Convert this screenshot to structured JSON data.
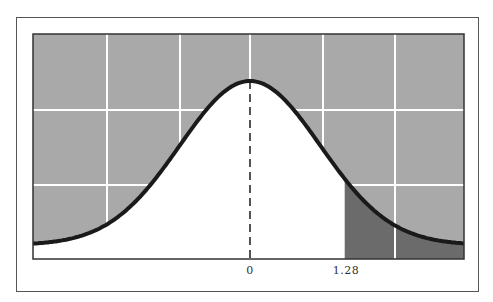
{
  "chart_data": {
    "type": "area",
    "title": "",
    "xlabel": "",
    "ylabel": "",
    "tick_labels": [
      "0",
      "1.28"
    ],
    "x_ticks": [
      0,
      1.28
    ],
    "xlim": [
      -3.1,
      3.0
    ],
    "distribution": {
      "name": "standard normal",
      "mean": 0,
      "sd": 1
    },
    "shaded_region": {
      "from": 1.28,
      "to": "inf",
      "side": "right tail"
    },
    "mean_line": {
      "x": 0,
      "style": "dashed"
    },
    "grid": true,
    "grid_vertical_count": 5,
    "grid_horizontal_count": 2,
    "legend": null
  },
  "colors": {
    "background_above_curve": "#a9a9a9",
    "under_curve": "#ffffff",
    "tail_shade": "#6b6b6b",
    "curve": "#1a1a1a",
    "grid": "#ffffff"
  },
  "labels": {
    "zero": "0",
    "critical": "1.28"
  }
}
